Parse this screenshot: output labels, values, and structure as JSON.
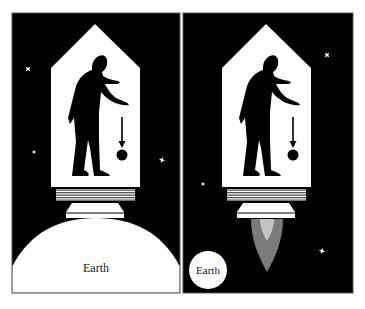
{
  "figure": {
    "colors": {
      "space": "#000000",
      "cabin": "#ffffff",
      "silhouette": "#000000",
      "stripe": "#555555",
      "flame_outer": "#7a7a7a",
      "flame_inner": "#c4c4c4",
      "earth": "#ffffff",
      "border": "#555555"
    },
    "panels": [
      {
        "id": "left",
        "scenario": "rocket at rest on Earth",
        "earth_label": "Earth",
        "earth_size": "large",
        "engine": "off"
      },
      {
        "id": "right",
        "scenario": "rocket accelerating in space",
        "earth_label": "Earth",
        "earth_size": "small",
        "engine": "firing"
      }
    ]
  }
}
